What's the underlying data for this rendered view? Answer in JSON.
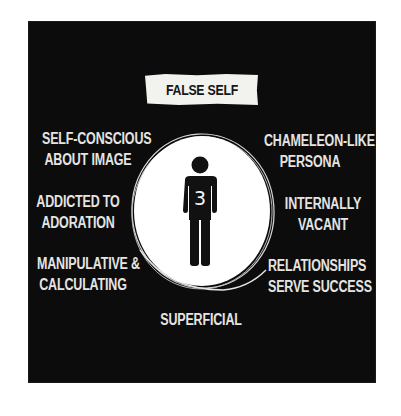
{
  "title": "FALSE SELF",
  "center": {
    "figure_icon": "person-icon",
    "number": "3"
  },
  "left_traits": [
    {
      "lines": [
        "SELF-CONSCIOUS",
        "ABOUT IMAGE"
      ]
    },
    {
      "lines": [
        "ADDICTED TO",
        "ADORATION"
      ]
    },
    {
      "lines": [
        "MANIPULATIVE &",
        "CALCULATING"
      ]
    }
  ],
  "right_traits": [
    {
      "lines": [
        "CHAMELEON-LIKE",
        "PERSONA"
      ]
    },
    {
      "lines": [
        "INTERNALLY",
        "VACANT"
      ]
    },
    {
      "lines": [
        "RELATIONSHIPS",
        "SERVE SUCCESS"
      ]
    }
  ],
  "bottom_trait": {
    "lines": [
      "SUPERFICIAL"
    ]
  },
  "colors": {
    "background": "#0c0c0c",
    "text": "#e4e4e2",
    "badge": "#f2f2ef",
    "circle": "#ffffff",
    "figure": "#111111"
  }
}
